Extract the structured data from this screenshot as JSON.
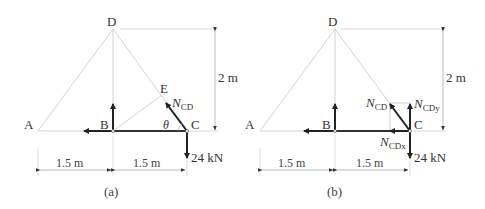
{
  "figure": {
    "panels": [
      {
        "caption": "(a)",
        "points": {
          "A": "A",
          "B": "B",
          "C": "C",
          "D": "D",
          "E": "E"
        },
        "angle_label": "θ",
        "force_label": {
          "main": "N",
          "sub": "CD"
        },
        "load": "24 kN",
        "dims": {
          "left": "1.5 m",
          "right": "1.5 m",
          "height": "2 m"
        }
      },
      {
        "caption": "(b)",
        "points": {
          "A": "A",
          "B": "B",
          "C": "C",
          "D": "D"
        },
        "force_label": {
          "main": "N",
          "sub": "CD"
        },
        "force_y_label": {
          "main": "N",
          "sub": "CDy"
        },
        "force_x_label": {
          "main": "N",
          "sub": "CDx"
        },
        "load": "24 kN",
        "dims": {
          "left": "1.5 m",
          "right": "1.5 m",
          "height": "2 m"
        }
      }
    ],
    "colors": {
      "truss": "#d0d0d0",
      "force": "#222222",
      "dim": "#bbbbbb",
      "text": "#333333"
    }
  }
}
